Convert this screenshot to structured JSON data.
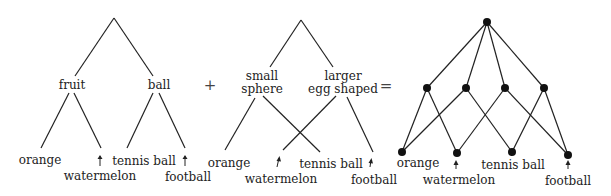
{
  "diagram_1": {
    "categories": [
      "fruit",
      "ball"
    ],
    "items": [
      "orange",
      "watermelon",
      "tennis ball",
      "football"
    ]
  },
  "operator_plus": "+",
  "diagram_2": {
    "categories": [
      "small",
      "sphere",
      "larger",
      "egg shaped"
    ],
    "items": [
      "orange",
      "watermelon",
      "tennis ball",
      "football"
    ]
  },
  "operator_equals": "=",
  "diagram_3": {
    "items": [
      "orange",
      "watermelon",
      "tennis ball",
      "football"
    ]
  }
}
